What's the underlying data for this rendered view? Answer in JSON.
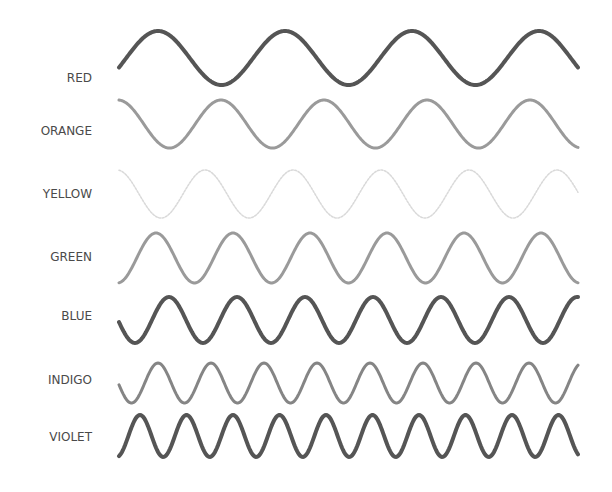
{
  "rows": [
    {
      "label": "RED",
      "color": "#555555",
      "stroke_width": 4.0,
      "opacity": 1.0,
      "label_y": 80,
      "center_y": 58,
      "amplitude": 27,
      "period": 127,
      "phase_x": 158
    },
    {
      "label": "ORANGE",
      "color": "#9a9a9a",
      "stroke_width": 3.0,
      "opacity": 1.0,
      "label_y": 133,
      "center_y": 124,
      "amplitude": 24,
      "period": 103,
      "phase_x": 221
    },
    {
      "label": "YELLOW",
      "color": "#cfcfcf",
      "stroke_width": 1.5,
      "opacity": 0.8,
      "label_y": 196,
      "center_y": 194,
      "amplitude": 24,
      "period": 88,
      "phase_x": 205
    },
    {
      "label": "GREEN",
      "color": "#9a9a9a",
      "stroke_width": 3.0,
      "opacity": 1.0,
      "label_y": 259,
      "center_y": 258,
      "amplitude": 25,
      "period": 77,
      "phase_x": 156
    },
    {
      "label": "BLUE",
      "color": "#555555",
      "stroke_width": 4.0,
      "opacity": 1.0,
      "label_y": 318,
      "center_y": 320,
      "amplitude": 23,
      "period": 68,
      "phase_x": 169
    },
    {
      "label": "INDIGO",
      "color": "#858585",
      "stroke_width": 3.0,
      "opacity": 1.0,
      "label_y": 382,
      "center_y": 383,
      "amplitude": 20,
      "period": 53,
      "phase_x": 158
    },
    {
      "label": "VIOLET",
      "color": "#555555",
      "stroke_width": 4.0,
      "opacity": 1.0,
      "label_y": 439,
      "center_y": 436,
      "amplitude": 21,
      "period": 46.5,
      "phase_x": 140
    }
  ],
  "wave_x_start": 119,
  "wave_x_end": 578
}
